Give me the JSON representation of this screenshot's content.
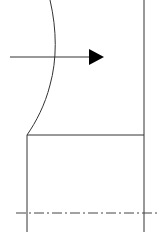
{
  "diagram": {
    "type": "technical-line-drawing",
    "background": "#ffffff",
    "stroke_color": "#333333",
    "centerline_color": "#444444",
    "elements": {
      "curved_surface": {
        "description": "curved profile boundary",
        "path": "M50,0 C57,30 57,60 50,85 C45,105 36,122 27,135"
      },
      "flow_arrow": {
        "x1": 10,
        "y1": 57,
        "x2": 89,
        "y2": 57,
        "head": "89,49 104,57 89,65",
        "direction": "right"
      },
      "right_edge": {
        "x": 144,
        "y1": 0,
        "y2": 232
      },
      "shoulder_line": {
        "y": 135,
        "x1": 27,
        "x2": 144
      },
      "left_edge": {
        "x": 27,
        "y1": 135,
        "y2": 232
      },
      "centerline": {
        "y": 213,
        "x1": 16,
        "x2": 157,
        "dash": "10,3,2,3"
      }
    }
  }
}
